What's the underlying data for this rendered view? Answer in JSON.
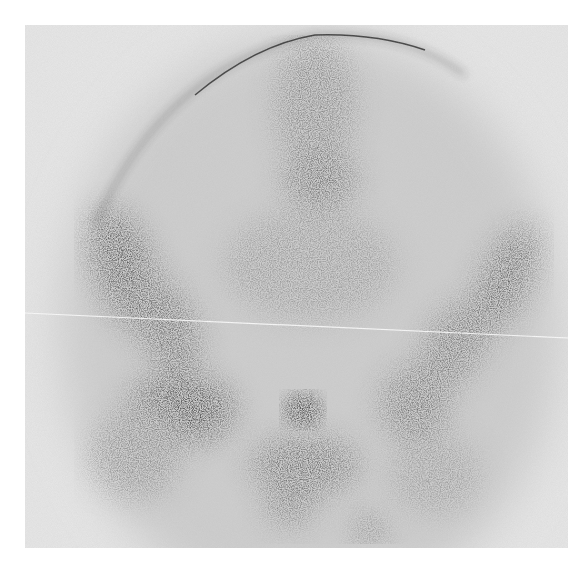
{
  "image": {
    "kind": "nuclear medicine bone scintigraphy",
    "view": "pelvis, anterior",
    "description": "Grayscale gamma-camera image of the pelvis showing tracer uptake in the lumbar spine, iliac wings, sacroiliac regions, hips and a focal bladder hotspot",
    "colors": {
      "background": "#ffffff",
      "film": "#e9e9e9",
      "uptake": "#111111"
    },
    "artifacts": [
      "faint horizontal white scratch line across mid-image",
      "dark curved detector field-of-view edge at top"
    ],
    "regions": [
      {
        "name": "lumbar-spine",
        "intensity": "moderate"
      },
      {
        "name": "left-iliac-wing",
        "intensity": "high"
      },
      {
        "name": "right-iliac-wing",
        "intensity": "moderate"
      },
      {
        "name": "left-hip",
        "intensity": "high"
      },
      {
        "name": "right-hip",
        "intensity": "moderate"
      },
      {
        "name": "bladder",
        "intensity": "very high"
      },
      {
        "name": "pubic-symphysis",
        "intensity": "moderate"
      }
    ]
  }
}
